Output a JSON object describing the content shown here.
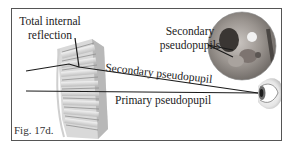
{
  "figure": {
    "caption": "Fig. 17d.",
    "labels": {
      "total_internal_reflection_line1": "Total internal",
      "total_internal_reflection_line2": "reflection",
      "secondary_pseudopupils_line1": "Secondary",
      "secondary_pseudopupils_line2": "pseudopupils",
      "secondary_pseudopupil": "Secondary pseudopupil",
      "primary_pseudopupil": "Primary pseudopupil"
    },
    "elements": {
      "ommatidia_bundle": "ommatidia-illustration",
      "inset_photo": "compound-eye-closeup",
      "observer_eye": "eye-icon"
    },
    "colors": {
      "frame": "#555555",
      "lines": "#1a1a1a",
      "ommatidia_light": "#e6e6e6",
      "ommatidia_dark": "#9a9a9a",
      "text": "#222222"
    }
  }
}
